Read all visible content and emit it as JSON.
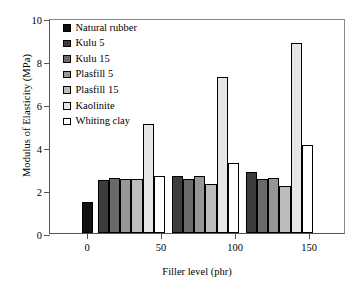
{
  "chart_data": {
    "type": "bar",
    "title": "",
    "xlabel": "Filler level (phr)",
    "ylabel": "Modulus of Elasticity (MPa)",
    "categories": [
      "0",
      "50",
      "100",
      "150"
    ],
    "xticks": [
      "0",
      "50",
      "100",
      "150"
    ],
    "yticks": [
      "0",
      "2",
      "4",
      "6",
      "8",
      "10"
    ],
    "ylim": [
      0,
      10
    ],
    "xlim": [
      -25,
      175
    ],
    "grid": false,
    "legend_position": "top-left",
    "series": [
      {
        "name": "Natural rubber",
        "color": "#101010",
        "edge": "#000000",
        "values": [
          1.42,
          null,
          null,
          null
        ]
      },
      {
        "name": "Kulu 5",
        "color": "#3d3d3d",
        "edge": "#000000",
        "values": [
          null,
          2.48,
          2.66,
          2.86
        ]
      },
      {
        "name": "Kulu 15",
        "color": "#6a6a6a",
        "edge": "#000000",
        "values": [
          null,
          2.56,
          2.49,
          2.5
        ]
      },
      {
        "name": "Plasfill 5",
        "color": "#969696",
        "edge": "#000000",
        "values": [
          null,
          2.51,
          2.66,
          2.58
        ]
      },
      {
        "name": "Plasfill 15",
        "color": "#bcbcbc",
        "edge": "#000000",
        "values": [
          null,
          2.5,
          2.29,
          2.2
        ]
      },
      {
        "name": "Kaolinite",
        "color": "#e6e6e6",
        "edge": "#000000",
        "values": [
          null,
          5.05,
          7.27,
          8.82
        ]
      },
      {
        "name": "Whiting clay",
        "color": "#ffffff",
        "edge": "#000000",
        "values": [
          null,
          2.66,
          3.27,
          4.08
        ]
      }
    ]
  }
}
